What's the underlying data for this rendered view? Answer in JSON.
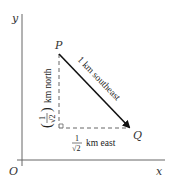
{
  "diagram": {
    "axes": {
      "x_label": "x",
      "y_label": "y",
      "origin_label": "O"
    },
    "points": {
      "P": "P",
      "Q": "Q"
    },
    "labels": {
      "hypotenuse": "1 km southeast",
      "east_num": "1",
      "east_den": "√2",
      "east_text": "km east",
      "north_num": "1",
      "north_den": "√2",
      "north_text": "km north"
    },
    "colors": {
      "arrow": "#111111",
      "dashed": "#666666",
      "axis": "#555555"
    }
  }
}
